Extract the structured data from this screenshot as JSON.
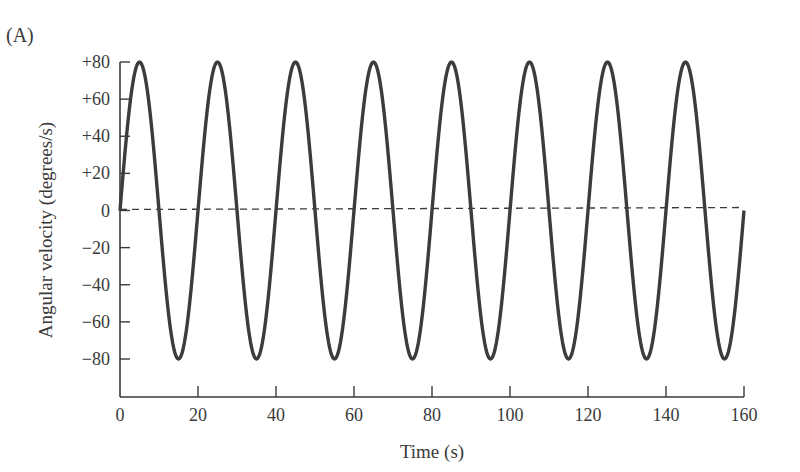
{
  "panel_label": "(A)",
  "chart_data": {
    "type": "line",
    "title": "",
    "xlabel": "Time (s)",
    "ylabel": "Angular velocity (degrees/s)",
    "xlim": [
      0,
      160
    ],
    "ylim": [
      -80,
      80
    ],
    "xticks": [
      0,
      20,
      40,
      60,
      80,
      100,
      120,
      140,
      160
    ],
    "xtick_labels": [
      "0",
      "20",
      "40",
      "60",
      "80",
      "100",
      "120",
      "140",
      "160"
    ],
    "yticks": [
      80,
      60,
      40,
      20,
      0,
      -20,
      -40,
      -60,
      -80
    ],
    "ytick_labels": [
      "+80",
      "+60",
      "+40",
      "+20",
      "0",
      "−20",
      "−40",
      "−60",
      "−80"
    ],
    "grid": false,
    "legend": null,
    "series": [
      {
        "name": "angular velocity",
        "function": "80*sin(2*pi*t/20)",
        "amplitude": 80,
        "period_s": 20,
        "x": [
          0,
          5,
          10,
          15,
          20,
          25,
          30,
          35,
          40,
          45,
          50,
          55,
          60,
          65,
          70,
          75,
          80,
          85,
          90,
          95,
          100,
          105,
          110,
          115,
          120,
          125,
          130,
          135,
          140,
          145,
          150,
          155,
          160
        ],
        "values": [
          0,
          80,
          0,
          -80,
          0,
          80,
          0,
          -80,
          0,
          80,
          0,
          -80,
          0,
          80,
          0,
          -80,
          0,
          80,
          0,
          -80,
          0,
          80,
          0,
          -80,
          0,
          80,
          0,
          -80,
          0,
          80,
          0,
          -80,
          0
        ],
        "style": "solid"
      },
      {
        "name": "zero reference",
        "x": [
          0,
          160
        ],
        "values": [
          0,
          0
        ],
        "style": "dashed"
      }
    ]
  }
}
